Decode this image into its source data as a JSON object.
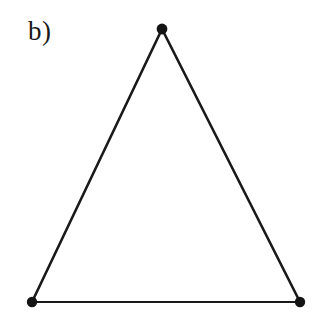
{
  "figure": {
    "panel_label": "b)",
    "background_color": "#ffffff",
    "ink_color": "#191919",
    "vertex_color": "#141414",
    "canvas": {
      "width": 324,
      "height": 330
    }
  },
  "chart_data": {
    "type": "scatter",
    "title": "b)",
    "subtitle": "",
    "xlabel": "",
    "ylabel": "",
    "grid": false,
    "legend": "none",
    "axis_visible": false,
    "tick_labels": [],
    "annotations": [
      {
        "name": "panel-label",
        "text": "b)",
        "x": 30,
        "y": 36
      }
    ],
    "xlim": [
      0,
      324
    ],
    "ylim": [
      330,
      0
    ],
    "nodes": [
      {
        "id": "apex",
        "label": "",
        "x": 162,
        "y": 29,
        "radius": 5.4
      },
      {
        "id": "bottom-left",
        "label": "",
        "x": 32,
        "y": 302,
        "radius": 5.2
      },
      {
        "id": "bottom-right",
        "label": "",
        "x": 300,
        "y": 302,
        "radius": 5.2
      }
    ],
    "edges": [
      {
        "id": "edge-left",
        "from": "apex",
        "to": "bottom-left",
        "width": 2.6
      },
      {
        "id": "edge-right",
        "from": "apex",
        "to": "bottom-right",
        "width": 2.6
      },
      {
        "id": "edge-bottom",
        "from": "bottom-left",
        "to": "bottom-right",
        "width": 2.1
      }
    ],
    "polygon_points": "162,29 300,302 32,302"
  }
}
